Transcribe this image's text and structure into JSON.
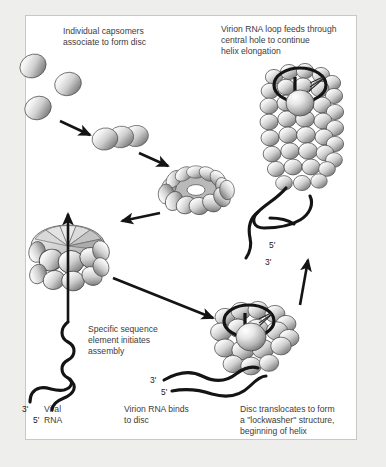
{
  "figure": {
    "background_color": "#eeeeec",
    "panel_color": "#ffffff",
    "panel_border_color": "#c8c8c4",
    "ink_color": "#141414",
    "text_color": "#3c3c3c"
  },
  "captions": {
    "capsomers": {
      "line1": "Individual capsomers",
      "line2": "associate to form disc"
    },
    "virion_loop": {
      "line1": "Virion RNA loop feeds through",
      "line2": "central hole to continue",
      "line3": "helix elongation"
    },
    "specific_sequence": {
      "line1": "Specific sequence",
      "line2": "element initiates",
      "line3": "assembly"
    },
    "rna_binds": {
      "line1": "Virion RNA binds",
      "line2": "to disc"
    },
    "translocates": {
      "line1": "Disc translocates to form",
      "line2": "a \"lockwasher\" structure,",
      "line3": "beginning of helix"
    },
    "viral_rna": {
      "line1": "Viral",
      "line2": "RNA"
    }
  },
  "labels": {
    "left_three_prime": "3'",
    "left_five_prime": "5'",
    "mid_three_prime": "3'",
    "mid_five_prime": "5'",
    "helix_five_prime": "5'",
    "helix_three_prime": "3'"
  },
  "structures": [
    {
      "name": "free-capsomer-1",
      "type": "capsomer",
      "cx": 33,
      "cy": 66
    },
    {
      "name": "free-capsomer-2",
      "type": "capsomer",
      "cx": 67,
      "cy": 83
    },
    {
      "name": "free-capsomer-3",
      "type": "capsomer",
      "cx": 38,
      "cy": 106
    },
    {
      "name": "capsomer-trimer",
      "type": "oligomer",
      "count": 3
    },
    {
      "name": "assembled-disc",
      "type": "disc-with-hole"
    },
    {
      "name": "disc-side-view",
      "type": "disc"
    },
    {
      "name": "lockwasher",
      "type": "lockwasher"
    },
    {
      "name": "elongating-helix",
      "type": "helix"
    }
  ],
  "arrows": [
    {
      "name": "arrow-capsomers-to-oligomer"
    },
    {
      "name": "arrow-oligomer-to-disc"
    },
    {
      "name": "arrow-disc-to-sideview"
    },
    {
      "name": "arrow-rna-up-through-disc"
    },
    {
      "name": "arrow-disc-to-lockwasher"
    },
    {
      "name": "arrow-lockwasher-to-helix"
    }
  ]
}
